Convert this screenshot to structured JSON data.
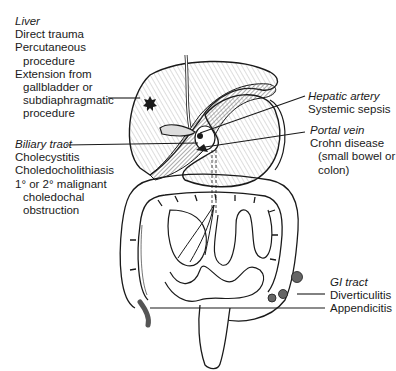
{
  "figure": {
    "labels": {
      "liver": {
        "heading": "Liver",
        "lines": [
          "Direct trauma",
          "Percutaneous",
          "procedure",
          "Extension from",
          "gallbladder or",
          "subdiaphragmatic",
          "procedure"
        ],
        "indented": [
          false,
          false,
          true,
          false,
          true,
          true,
          true
        ]
      },
      "biliary": {
        "heading": "Biliary tract",
        "lines": [
          "Cholecystitis",
          "Choledocholithiasis",
          "1° or 2° malignant",
          "choledochal",
          "obstruction"
        ],
        "indented": [
          false,
          false,
          false,
          true,
          true
        ]
      },
      "hepatic_artery": {
        "heading": "Hepatic artery",
        "lines": [
          "Systemic sepsis"
        ]
      },
      "portal_vein": {
        "heading": "Portal vein",
        "lines": [
          "Crohn disease",
          "(small bowel or",
          "colon)"
        ],
        "indented": [
          false,
          true,
          true
        ]
      },
      "gi_tract": {
        "heading": "GI tract",
        "lines": [
          "Diverticulitis",
          "Appendicitis"
        ]
      }
    },
    "colors": {
      "ink": "#1a1a1a",
      "hatch": "#555555",
      "background": "#ffffff",
      "shade": "#6e6e6e"
    }
  }
}
